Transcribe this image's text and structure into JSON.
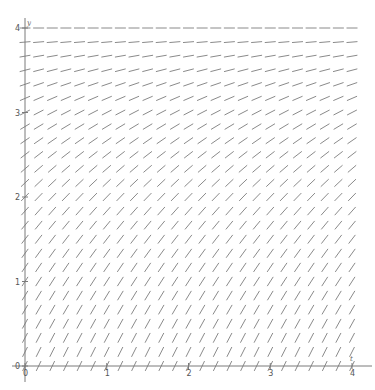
{
  "chart_data": {
    "type": "slope_field",
    "title": "",
    "equation": "dy/dt = (4 - y)/2",
    "xlabel": "t",
    "ylabel": "y",
    "xlim": [
      0,
      4
    ],
    "ylim": [
      0,
      4
    ],
    "x_ticks": [
      0,
      1,
      2,
      3,
      4
    ],
    "y_ticks": [
      0,
      1,
      2,
      3,
      4
    ],
    "x_tick_labels": [
      "0",
      "1",
      "2",
      "3",
      "4"
    ],
    "y_tick_labels": [
      "0",
      "1",
      "2",
      "3",
      "4"
    ],
    "grid_step": 0.16667,
    "grid_points": 25,
    "slope_by_y": [
      {
        "y": 0,
        "slope": 2.0
      },
      {
        "y": 1,
        "slope": 1.5
      },
      {
        "y": 2,
        "slope": 1.0
      },
      {
        "y": 3,
        "slope": 0.5
      },
      {
        "y": 4,
        "slope": 0.0
      }
    ],
    "grid": false,
    "legend": null,
    "segment_color": "#8a8a8a",
    "axis_color": "#7a7a7a"
  }
}
